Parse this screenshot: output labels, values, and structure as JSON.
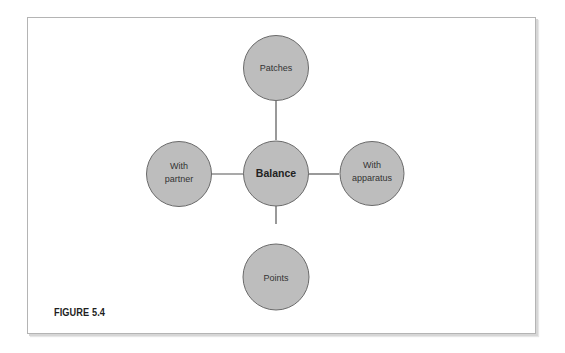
{
  "figure": {
    "caption": "FIGURE 5.4"
  },
  "diagram": {
    "type": "hub-and-spoke",
    "colors": {
      "node_fill": "#bdbdbd",
      "node_stroke": "#6a6a6a",
      "connector": "#555555",
      "text": "#333333"
    },
    "center": {
      "label": "Balance"
    },
    "nodes": {
      "top": {
        "lines": [
          "Patches"
        ]
      },
      "left": {
        "lines": [
          "With",
          "partner"
        ]
      },
      "right": {
        "lines": [
          "With",
          "apparatus"
        ]
      },
      "bottom": {
        "lines": [
          "Points"
        ]
      }
    },
    "edges": [
      [
        "Balance",
        "Patches"
      ],
      [
        "Balance",
        "With partner"
      ],
      [
        "Balance",
        "With apparatus"
      ],
      [
        "Balance",
        "Points"
      ]
    ]
  }
}
